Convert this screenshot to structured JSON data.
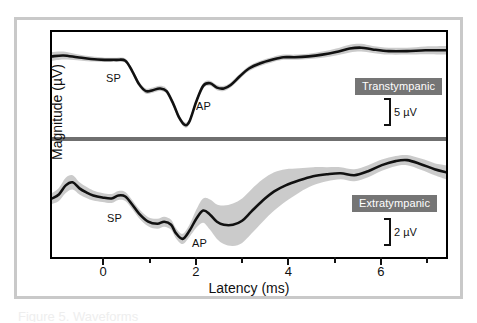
{
  "figure": {
    "y_axis_label": "Magnitude (µV)",
    "x_axis_label": "Latency (ms)",
    "caption_fragment": "Figure 5. Waveforms"
  },
  "panels": [
    {
      "id": "transtympanic",
      "condition_label": "Transtympanic",
      "scale_value": "5 µV",
      "peaks": [
        {
          "name": "SP",
          "label": "SP"
        },
        {
          "name": "AP",
          "label": "AP"
        }
      ]
    },
    {
      "id": "extratympanic",
      "condition_label": "Extratympanic",
      "scale_value": "2 µV",
      "peaks": [
        {
          "name": "SP",
          "label": "SP"
        },
        {
          "name": "AP",
          "label": "AP"
        }
      ]
    }
  ],
  "axis": {
    "x_tick_labels": [
      "0",
      "2",
      "4",
      "6"
    ],
    "x_major_ticks": [
      0,
      2,
      4,
      6
    ],
    "x_minor_ticks": [
      1,
      3,
      5,
      7
    ],
    "x_range": [
      -1.15,
      7.45
    ]
  },
  "colors": {
    "trace": "#111111",
    "band": "#c4c4c4",
    "badge_bg": "#757575",
    "badge_text": "#ffffff",
    "frame": "#c9c9c9",
    "divider": "#6f6f6f"
  },
  "chart_data": {
    "type": "line",
    "title": "",
    "xlabel": "Latency (ms)",
    "ylabel": "Magnitude (µV)",
    "xlim": [
      -1.15,
      7.45
    ],
    "grid": false,
    "legend": "inline-badges",
    "annotations": [
      {
        "panel": "transtympanic",
        "text": "SP",
        "x": 0.45,
        "note": "summating potential shoulder"
      },
      {
        "panel": "transtympanic",
        "text": "AP",
        "x": 1.75,
        "note": "action potential trough"
      },
      {
        "panel": "extratympanic",
        "text": "SP",
        "x": 0.55,
        "note": "summating potential shoulder"
      },
      {
        "panel": "extratympanic",
        "text": "AP",
        "x": 1.75,
        "note": "action potential trough"
      }
    ],
    "series": [
      {
        "name": "Transtympanic",
        "panel": "transtympanic",
        "scale_bar_uv": 5,
        "x": [
          -1.15,
          -0.9,
          -0.6,
          -0.3,
          0.0,
          0.25,
          0.45,
          0.6,
          0.75,
          0.9,
          1.05,
          1.2,
          1.35,
          1.5,
          1.62,
          1.75,
          1.85,
          2.0,
          2.15,
          2.3,
          2.45,
          2.6,
          2.75,
          2.95,
          3.15,
          3.4,
          3.65,
          3.9,
          4.15,
          4.45,
          4.75,
          5.05,
          5.35,
          5.6,
          5.85,
          6.2,
          6.6,
          7.0,
          7.45
        ],
        "values": [
          8.6,
          8.7,
          8.5,
          8.3,
          8.2,
          8.2,
          8.1,
          6.9,
          5.4,
          4.6,
          4.7,
          4.9,
          4.6,
          3.1,
          1.6,
          0.7,
          1.1,
          3.4,
          5.2,
          5.5,
          5.0,
          4.9,
          5.3,
          6.3,
          7.2,
          7.8,
          8.2,
          8.5,
          8.5,
          8.6,
          8.8,
          9.1,
          9.5,
          9.6,
          9.4,
          9.2,
          9.2,
          9.3,
          9.3
        ],
        "band_halfwidth": [
          0.5,
          0.45,
          0.35,
          0.3,
          0.25,
          0.25,
          0.25,
          0.3,
          0.3,
          0.3,
          0.3,
          0.3,
          0.3,
          0.3,
          0.3,
          0.3,
          0.3,
          0.3,
          0.3,
          0.3,
          0.3,
          0.3,
          0.3,
          0.3,
          0.3,
          0.3,
          0.3,
          0.3,
          0.3,
          0.3,
          0.35,
          0.4,
          0.45,
          0.45,
          0.4,
          0.4,
          0.4,
          0.45,
          0.5
        ]
      },
      {
        "name": "Extratympanic",
        "panel": "extratympanic",
        "scale_bar_uv": 2,
        "x": [
          -1.15,
          -1.0,
          -0.85,
          -0.7,
          -0.55,
          -0.4,
          -0.25,
          -0.05,
          0.15,
          0.3,
          0.45,
          0.6,
          0.75,
          0.95,
          1.15,
          1.3,
          1.45,
          1.55,
          1.7,
          1.85,
          2.0,
          2.15,
          2.3,
          2.45,
          2.6,
          2.8,
          3.0,
          3.2,
          3.45,
          3.7,
          3.95,
          4.25,
          4.55,
          4.85,
          5.15,
          5.45,
          5.75,
          6.05,
          6.35,
          6.6,
          6.9,
          7.2,
          7.45
        ],
        "values": [
          5.6,
          6.0,
          6.9,
          7.2,
          6.6,
          6.2,
          5.9,
          5.7,
          5.6,
          5.9,
          5.8,
          5.0,
          4.1,
          3.3,
          3.1,
          3.3,
          3.0,
          2.2,
          1.6,
          2.4,
          3.6,
          4.4,
          4.0,
          3.3,
          3.0,
          3.0,
          3.4,
          4.3,
          5.4,
          6.3,
          6.9,
          7.4,
          7.8,
          8.0,
          8.1,
          7.9,
          8.3,
          8.9,
          9.3,
          9.4,
          9.0,
          8.5,
          8.2
        ],
        "band_halfwidth": [
          0.55,
          0.65,
          0.75,
          0.7,
          0.6,
          0.55,
          0.5,
          0.45,
          0.45,
          0.45,
          0.45,
          0.45,
          0.45,
          0.45,
          0.5,
          0.5,
          0.5,
          0.5,
          0.5,
          0.6,
          0.9,
          1.2,
          1.5,
          1.7,
          1.9,
          2.1,
          2.2,
          2.2,
          2.1,
          1.9,
          1.6,
          1.2,
          0.9,
          0.7,
          0.6,
          0.6,
          0.6,
          0.55,
          0.5,
          0.5,
          0.55,
          0.6,
          0.7
        ]
      }
    ]
  }
}
